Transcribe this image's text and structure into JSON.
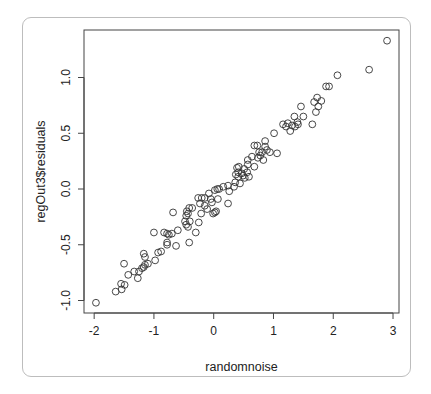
{
  "chart_data": {
    "type": "scatter",
    "title": "",
    "xlabel": "randomnoise",
    "ylabel": "regOut3$residuals",
    "xlim": [
      -2.17,
      3.1
    ],
    "ylim": [
      -1.112,
      1.426
    ],
    "x_ticks": [
      -2,
      -1,
      0,
      1,
      2,
      3
    ],
    "x_tick_labels": [
      "-2",
      "-1",
      "0",
      "1",
      "2",
      "3"
    ],
    "y_ticks": [
      -1.0,
      -0.5,
      0.0,
      0.5,
      1.0
    ],
    "y_tick_labels": [
      "-1.0",
      "-0.5",
      "0.0",
      "0.5",
      "1.0"
    ],
    "grid": false,
    "legend": null,
    "marker": "open-circle",
    "colors": {
      "marker": "#333333",
      "axis": "#444444",
      "card_border": "#bdbdbd"
    },
    "points": [
      [
        -1.97,
        -1.02
      ],
      [
        -1.64,
        -0.92
      ],
      [
        -1.55,
        -0.85
      ],
      [
        -1.54,
        -0.9
      ],
      [
        -1.49,
        -0.86
      ],
      [
        -1.5,
        -0.67
      ],
      [
        -1.43,
        -0.77
      ],
      [
        -1.33,
        -0.74
      ],
      [
        -1.27,
        -0.8
      ],
      [
        -1.25,
        -0.74
      ],
      [
        -1.2,
        -0.71
      ],
      [
        -1.17,
        -0.7
      ],
      [
        -1.15,
        -0.68
      ],
      [
        -1.1,
        -0.67
      ],
      [
        -1.17,
        -0.58
      ],
      [
        -1.15,
        -0.61
      ],
      [
        -0.98,
        -0.64
      ],
      [
        -0.93,
        -0.57
      ],
      [
        -0.88,
        -0.56
      ],
      [
        -1.0,
        -0.39
      ],
      [
        -0.83,
        -0.39
      ],
      [
        -0.78,
        -0.48
      ],
      [
        -0.78,
        -0.4
      ],
      [
        -0.78,
        -0.5
      ],
      [
        -0.75,
        -0.41
      ],
      [
        -0.7,
        -0.4
      ],
      [
        -0.63,
        -0.51
      ],
      [
        -0.6,
        -0.37
      ],
      [
        -0.68,
        -0.21
      ],
      [
        -0.48,
        -0.29
      ],
      [
        -0.46,
        -0.24
      ],
      [
        -0.45,
        -0.2
      ],
      [
        -0.43,
        -0.22
      ],
      [
        -0.41,
        -0.17
      ],
      [
        -0.36,
        -0.17
      ],
      [
        -0.46,
        -0.32
      ],
      [
        -0.43,
        -0.34
      ],
      [
        -0.4,
        -0.29
      ],
      [
        -0.41,
        -0.48
      ],
      [
        -0.3,
        -0.39
      ],
      [
        -0.25,
        -0.3
      ],
      [
        -0.21,
        -0.22
      ],
      [
        -0.26,
        -0.08
      ],
      [
        -0.2,
        -0.08
      ],
      [
        -0.23,
        -0.13
      ],
      [
        -0.15,
        -0.08
      ],
      [
        -0.15,
        -0.15
      ],
      [
        -0.11,
        -0.18
      ],
      [
        -0.08,
        -0.04
      ],
      [
        -0.05,
        -0.09
      ],
      [
        -0.03,
        -0.12
      ],
      [
        -0.01,
        -0.22
      ],
      [
        0.02,
        -0.21
      ],
      [
        0.02,
        -0.01
      ],
      [
        0.06,
        0.0
      ],
      [
        0.04,
        -0.2
      ],
      [
        0.07,
        -0.09
      ],
      [
        0.09,
        0.0
      ],
      [
        0.16,
        0.02
      ],
      [
        0.24,
        0.03
      ],
      [
        0.26,
        -0.02
      ],
      [
        0.24,
        -0.13
      ],
      [
        0.34,
        0.02
      ],
      [
        0.36,
        0.06
      ],
      [
        0.37,
        0.13
      ],
      [
        0.39,
        0.19
      ],
      [
        0.41,
        0.11
      ],
      [
        0.41,
        0.15
      ],
      [
        0.42,
        0.2
      ],
      [
        0.44,
        0.05
      ],
      [
        0.47,
        0.14
      ],
      [
        0.49,
        0.12
      ],
      [
        0.51,
        0.18
      ],
      [
        0.52,
        0.1
      ],
      [
        0.56,
        0.15
      ],
      [
        0.57,
        0.22
      ],
      [
        0.57,
        0.26
      ],
      [
        0.59,
        0.11
      ],
      [
        0.64,
        0.29
      ],
      [
        0.68,
        0.2
      ],
      [
        0.74,
        0.28
      ],
      [
        0.78,
        0.3
      ],
      [
        0.81,
        0.33
      ],
      [
        0.83,
        0.26
      ],
      [
        0.86,
        0.38
      ],
      [
        0.89,
        0.35
      ],
      [
        0.68,
        0.39
      ],
      [
        0.94,
        0.33
      ],
      [
        0.86,
        0.43
      ],
      [
        0.73,
        0.39
      ],
      [
        0.76,
        0.33
      ],
      [
        1.06,
        0.32
      ],
      [
        1.01,
        0.5
      ],
      [
        1.16,
        0.58
      ],
      [
        1.21,
        0.56
      ],
      [
        1.24,
        0.59
      ],
      [
        1.28,
        0.52
      ],
      [
        1.31,
        0.57
      ],
      [
        1.35,
        0.65
      ],
      [
        1.36,
        0.56
      ],
      [
        1.4,
        0.6
      ],
      [
        1.41,
        0.58
      ],
      [
        1.46,
        0.74
      ],
      [
        1.5,
        0.65
      ],
      [
        1.65,
        0.58
      ],
      [
        1.68,
        0.78
      ],
      [
        1.71,
        0.69
      ],
      [
        1.75,
        0.74
      ],
      [
        1.73,
        0.82
      ],
      [
        1.8,
        0.79
      ],
      [
        1.88,
        0.92
      ],
      [
        1.93,
        0.92
      ],
      [
        2.07,
        1.02
      ],
      [
        2.6,
        1.07
      ],
      [
        2.9,
        1.33
      ]
    ]
  }
}
